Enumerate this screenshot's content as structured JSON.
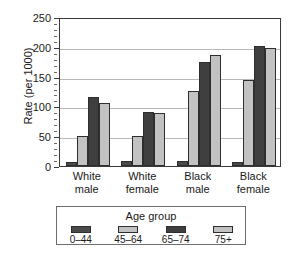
{
  "chart_data": {
    "type": "bar",
    "title": "",
    "subtitle": "",
    "xlabel": "",
    "ylabel": "Rate (per 1000)",
    "categories": [
      "White male",
      "White female",
      "Black male",
      "Black female"
    ],
    "category_lines": [
      [
        "White",
        "male"
      ],
      [
        "White",
        "female"
      ],
      [
        "Black",
        "male"
      ],
      [
        "Black",
        "female"
      ]
    ],
    "series": [
      {
        "name": "0–44",
        "values": [
          7,
          9,
          8,
          7
        ],
        "color": "#4a4a4a"
      },
      {
        "name": "45–64",
        "values": [
          50,
          50,
          126,
          144
        ],
        "color": "#c2c2c2"
      },
      {
        "name": "65–74",
        "values": [
          115,
          91,
          175,
          201
        ],
        "color": "#3f3f3f"
      },
      {
        "name": "75+",
        "values": [
          106,
          89,
          187,
          198
        ],
        "color": "#c2c2c2"
      }
    ],
    "ylim": [
      0,
      250
    ],
    "yticks": [
      0,
      50,
      100,
      150,
      200,
      250
    ],
    "ytick_labels": [
      "0",
      "50",
      "100",
      "150",
      "200",
      "250"
    ],
    "yminor_step": 10,
    "grid": true,
    "grid_axis": "y",
    "legend": {
      "title": "Age group",
      "position": "bottom",
      "entries": [
        "0–44",
        "45–64",
        "65–74",
        "75+"
      ]
    },
    "colors": {
      "dark_bar": "#4a4a4a",
      "light_bar": "#c2c2c2",
      "axis": "#3a3a3a",
      "gridline": "#b9b9b9",
      "background": "#ffffff",
      "text": "#1a1a1a",
      "legend_border": "#6d6d6d"
    }
  }
}
